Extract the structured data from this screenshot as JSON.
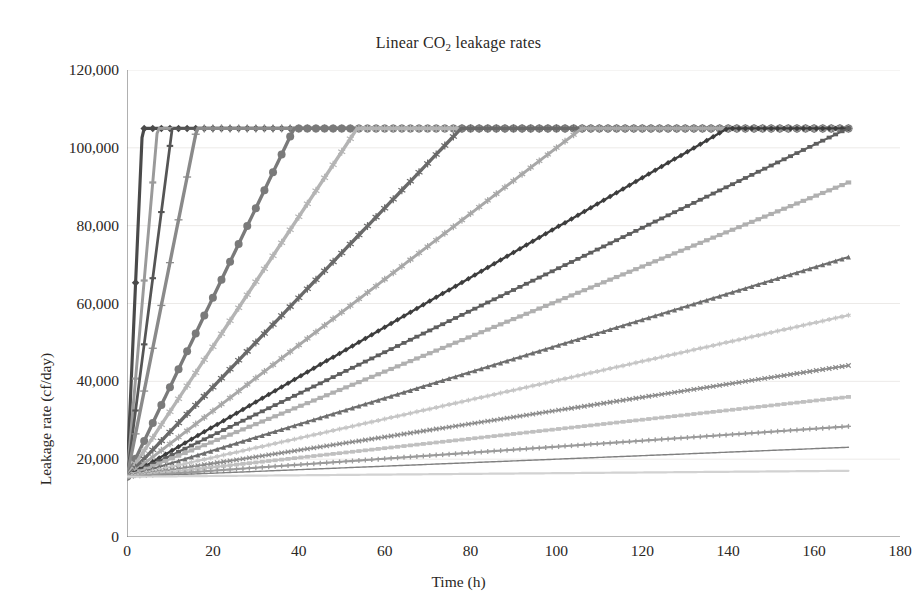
{
  "chart_data": {
    "type": "line",
    "title": "Linear CO2 leakage rates",
    "title_html": "Linear CO<sub>2</sub> leakage rates",
    "xlabel": "Time (h)",
    "ylabel": "Leakage rate (cf/day)",
    "xlim": [
      0,
      180
    ],
    "ylim": [
      0,
      120000
    ],
    "xticks": [
      0,
      20,
      40,
      60,
      80,
      100,
      120,
      140,
      160,
      180
    ],
    "xtick_labels": [
      "0",
      "20",
      "40",
      "60",
      "80",
      "100",
      "120",
      "140",
      "160",
      "180"
    ],
    "yticks": [
      0,
      20000,
      40000,
      60000,
      80000,
      100000,
      120000
    ],
    "ytick_labels": [
      "0",
      "20,000",
      "40,000",
      "60,000",
      "80,000",
      "100,000",
      "120,000"
    ],
    "grid": "horizontal",
    "legend": "none",
    "baseline_y": 15500,
    "ceiling_y": 105000,
    "x_end": 168,
    "series": [
      {
        "name": "rate-01",
        "marker": "diamond",
        "color": "#4a4a4a",
        "size": 7.5,
        "slope": 24900,
        "sat_x": 3.6,
        "values_at": {
          "t0": 15500,
          "t168": 105000
        }
      },
      {
        "name": "rate-02",
        "marker": "dash",
        "color": "#9a9a9a",
        "size": 7,
        "slope": 12600,
        "sat_x": 7.1,
        "values_at": {
          "t0": 15500,
          "t168": 105000
        }
      },
      {
        "name": "rate-03",
        "marker": "dash",
        "color": "#555555",
        "size": 6.5,
        "slope": 8500,
        "sat_x": 10.5,
        "values_at": {
          "t0": 15500,
          "t168": 105000
        }
      },
      {
        "name": "rate-04",
        "marker": "plus",
        "color": "#8a8a8a",
        "size": 8,
        "slope": 5500,
        "sat_x": 16.3,
        "values_at": {
          "t0": 15500,
          "t168": 105000
        }
      },
      {
        "name": "rate-05",
        "marker": "circle",
        "color": "#7a7a7a",
        "size": 8,
        "slope": 2300,
        "sat_x": 39.0,
        "values_at": {
          "t0": 15500,
          "t168": 105000
        }
      },
      {
        "name": "rate-06",
        "marker": "asterisk",
        "color": "#b4b4b4",
        "size": 8,
        "slope": 1670,
        "sat_x": 53.5,
        "values_at": {
          "t0": 15500,
          "t168": 105000
        }
      },
      {
        "name": "rate-07",
        "marker": "asterisk",
        "color": "#6a6a6a",
        "size": 8,
        "slope": 1150,
        "sat_x": 77.8,
        "values_at": {
          "t0": 15500,
          "t168": 105000
        }
      },
      {
        "name": "rate-08",
        "marker": "asterisk",
        "color": "#a8a8a8",
        "size": 7,
        "slope": 845,
        "sat_x": 106.0,
        "values_at": {
          "t0": 15500,
          "t168": 105000
        }
      },
      {
        "name": "rate-09",
        "marker": "diamond",
        "color": "#3d3d3d",
        "size": 5.5,
        "slope": 640,
        "sat_x": 140.0,
        "values_at": {
          "t0": 15500,
          "t168": 105000
        }
      },
      {
        "name": "rate-10",
        "marker": "square",
        "color": "#5f5f5f",
        "size": 5,
        "slope": 533,
        "sat_x": 168.0,
        "values_at": {
          "t0": 15500,
          "t168": 105000
        }
      },
      {
        "name": "rate-11",
        "marker": "square",
        "color": "#b0b0b0",
        "size": 5.5,
        "slope": 450,
        "sat_x": null,
        "values_at": {
          "t0": 15500,
          "t168": 91000
        }
      },
      {
        "name": "rate-12",
        "marker": "triangle",
        "color": "#6e6e6e",
        "size": 5,
        "slope": 336,
        "sat_x": null,
        "values_at": {
          "t0": 15500,
          "t168": 72000
        }
      },
      {
        "name": "rate-13",
        "marker": "asterisk",
        "color": "#c6c6c6",
        "size": 5,
        "slope": 247,
        "sat_x": null,
        "values_at": {
          "t0": 15500,
          "t168": 57000
        }
      },
      {
        "name": "rate-14",
        "marker": "x",
        "color": "#8c8c8c",
        "size": 4.5,
        "slope": 170,
        "sat_x": null,
        "values_at": {
          "t0": 15500,
          "t168": 44000
        }
      },
      {
        "name": "rate-15",
        "marker": "square",
        "color": "#c0c0c0",
        "size": 5,
        "slope": 122,
        "sat_x": null,
        "values_at": {
          "t0": 15500,
          "t168": 36000
        }
      },
      {
        "name": "rate-16",
        "marker": "plus",
        "color": "#9b9b9b",
        "size": 5,
        "slope": 77,
        "sat_x": null,
        "values_at": {
          "t0": 15500,
          "t168": 28500
        }
      },
      {
        "name": "rate-17",
        "marker": "line",
        "color": "#808080",
        "size": 1.4,
        "slope": 45,
        "sat_x": null,
        "values_at": {
          "t0": 15500,
          "t168": 23000
        }
      },
      {
        "name": "rate-18",
        "marker": "line",
        "color": "#d2d2d2",
        "size": 2.2,
        "slope": 9,
        "sat_x": null,
        "values_at": {
          "t0": 15500,
          "t168": 17000
        }
      }
    ]
  },
  "axes": {
    "axis_color": "#6f6f6f",
    "grid_color": "#eceae8",
    "background": "#ffffff"
  }
}
